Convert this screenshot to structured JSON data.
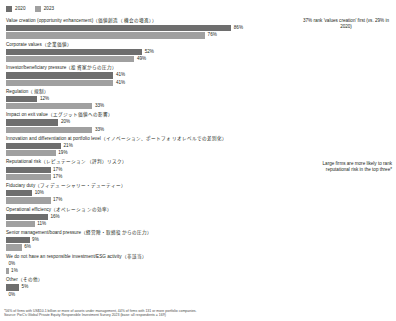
{
  "legend": {
    "items": [
      {
        "label": "2020",
        "color": "#6e6e6e"
      },
      {
        "label": "2023",
        "color": "#a0a0a0"
      }
    ]
  },
  "callouts": {
    "a": "37% rank 'values creation' first (vs. 29% in 2020)",
    "b": "Large firms are more likely to rank reputational risk in the top three*"
  },
  "footnote": {
    "line1": "*56% of firms with US$10.1 billion or more of assets under management, 44% of firms with 131 or more portfolio companies.",
    "line2": "Source: PwC's Global Private Equity Responsible Investment Survey 2023 (base: all respondents = 169)"
  },
  "chart_data": {
    "type": "bar",
    "orientation": "horizontal",
    "title": "",
    "xlabel": "",
    "ylabel": "",
    "xlim": [
      0,
      100
    ],
    "grid": false,
    "legend_position": "top-left",
    "categories": [
      "Value creation (opportunity enhancement)（価値創造（機会の増進））",
      "Corporate values（企業価値）",
      "Investor/beneficiary pressure（投資家からの圧力）",
      "Regulation（規制）",
      "Impact on exit value（エグジット価値への影響）",
      "Innovation and differentiation at portfolio level（イノベーション、ポートフォリオレベルでの差別化）",
      "Reputational risk（レピュテーション（評判）リスク）",
      "Fiduciary duty（フィデューシャリー・デューティー）",
      "Operational efficiency（オペレーションの効率）",
      "Senior management/board pressure（経営陣・取締役からの圧力）",
      "We do not have an responsible investment/ESG activity（非該当）",
      "Other（その他）"
    ],
    "series": [
      {
        "name": "2020",
        "color": "#6e6e6e",
        "values": [
          86,
          52,
          41,
          12,
          20,
          21,
          17,
          10,
          16,
          9,
          0,
          5
        ],
        "labels": [
          "86%",
          "52%",
          "41%",
          "12%",
          "20%",
          "21%",
          "17%",
          "10%",
          "16%",
          "9%",
          "0%",
          "5%"
        ]
      },
      {
        "name": "2023",
        "color": "#a0a0a0",
        "values": [
          76,
          49,
          41,
          33,
          33,
          19,
          17,
          17,
          11,
          6,
          1,
          0
        ],
        "labels": [
          "76%",
          "49%",
          "41%",
          "33%",
          "33%",
          "19%",
          "17%",
          "17%",
          "11%",
          "6%",
          "1%",
          "0%"
        ]
      }
    ]
  }
}
